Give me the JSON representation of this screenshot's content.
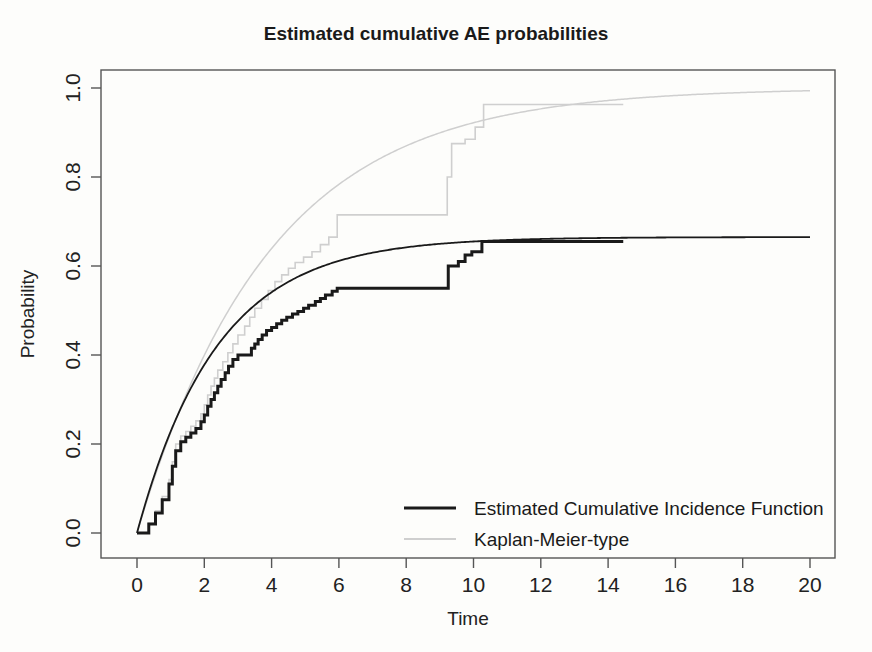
{
  "chart_data": {
    "type": "line",
    "title": "Estimated cumulative AE probabilities",
    "xlabel": "Time",
    "ylabel": "Probability",
    "xlim": [
      0,
      20
    ],
    "ylim": [
      0,
      1.0
    ],
    "xticks": [
      0,
      2,
      4,
      6,
      8,
      10,
      12,
      14,
      16,
      18,
      20
    ],
    "xtick_labels": [
      "0",
      "2",
      "4",
      "6",
      "8",
      "10",
      "12",
      "14",
      "16",
      "18",
      "20"
    ],
    "yticks": [
      0.0,
      0.2,
      0.4,
      0.6,
      0.8,
      1.0
    ],
    "ytick_labels": [
      "0.0",
      "0.2",
      "0.4",
      "0.6",
      "0.8",
      "1.0"
    ],
    "grid": false,
    "legend_position": "bottom-right",
    "series": [
      {
        "name": "Estimated Cumulative Incidence Function",
        "style": "step",
        "color": "#1a1a1a",
        "width": 3.0,
        "points": [
          [
            0.0,
            0.0
          ],
          [
            0.35,
            0.02
          ],
          [
            0.55,
            0.045
          ],
          [
            0.75,
            0.075
          ],
          [
            0.95,
            0.11
          ],
          [
            1.05,
            0.15
          ],
          [
            1.15,
            0.185
          ],
          [
            1.3,
            0.205
          ],
          [
            1.45,
            0.215
          ],
          [
            1.6,
            0.225
          ],
          [
            1.75,
            0.235
          ],
          [
            1.9,
            0.25
          ],
          [
            2.0,
            0.265
          ],
          [
            2.1,
            0.285
          ],
          [
            2.2,
            0.3
          ],
          [
            2.3,
            0.315
          ],
          [
            2.4,
            0.33
          ],
          [
            2.5,
            0.345
          ],
          [
            2.62,
            0.36
          ],
          [
            2.72,
            0.375
          ],
          [
            2.85,
            0.39
          ],
          [
            3.0,
            0.4
          ],
          [
            3.35,
            0.4
          ],
          [
            3.4,
            0.415
          ],
          [
            3.5,
            0.425
          ],
          [
            3.6,
            0.435
          ],
          [
            3.72,
            0.445
          ],
          [
            3.85,
            0.455
          ],
          [
            4.0,
            0.462
          ],
          [
            4.15,
            0.47
          ],
          [
            4.3,
            0.478
          ],
          [
            4.45,
            0.485
          ],
          [
            4.62,
            0.492
          ],
          [
            4.78,
            0.498
          ],
          [
            4.95,
            0.505
          ],
          [
            5.1,
            0.512
          ],
          [
            5.3,
            0.52
          ],
          [
            5.45,
            0.527
          ],
          [
            5.6,
            0.535
          ],
          [
            5.8,
            0.543
          ],
          [
            5.95,
            0.55
          ],
          [
            9.15,
            0.55
          ],
          [
            9.25,
            0.6
          ],
          [
            9.55,
            0.61
          ],
          [
            9.75,
            0.625
          ],
          [
            9.95,
            0.632
          ],
          [
            10.25,
            0.655
          ],
          [
            14.45,
            0.655
          ]
        ]
      },
      {
        "name": "Estimated Cumulative Incidence Function (model)",
        "style": "smooth",
        "color": "#1a1a1a",
        "width": 1.8,
        "asymptote": 0.665,
        "rate": 0.42,
        "points": [
          [
            0.0,
            0.0
          ],
          [
            0.5,
            0.127
          ],
          [
            1.0,
            0.227
          ],
          [
            1.5,
            0.311
          ],
          [
            2.0,
            0.378
          ],
          [
            2.5,
            0.432
          ],
          [
            3.0,
            0.476
          ],
          [
            3.5,
            0.512
          ],
          [
            4.0,
            0.541
          ],
          [
            4.5,
            0.564
          ],
          [
            5.0,
            0.583
          ],
          [
            5.5,
            0.598
          ],
          [
            6.0,
            0.611
          ],
          [
            7.0,
            0.629
          ],
          [
            8.0,
            0.641
          ],
          [
            9.0,
            0.649
          ],
          [
            10.0,
            0.655
          ],
          [
            12.0,
            0.66
          ],
          [
            14.0,
            0.663
          ],
          [
            16.0,
            0.664
          ],
          [
            18.0,
            0.665
          ],
          [
            20.0,
            0.665
          ]
        ]
      },
      {
        "name": "Kaplan-Meier-type",
        "style": "step",
        "color": "#cfcfcf",
        "width": 1.6,
        "points": [
          [
            0.0,
            0.0
          ],
          [
            0.35,
            0.022
          ],
          [
            0.55,
            0.05
          ],
          [
            0.75,
            0.082
          ],
          [
            0.95,
            0.12
          ],
          [
            1.05,
            0.16
          ],
          [
            1.15,
            0.2
          ],
          [
            1.3,
            0.218
          ],
          [
            1.45,
            0.228
          ],
          [
            1.6,
            0.24
          ],
          [
            1.75,
            0.252
          ],
          [
            1.9,
            0.268
          ],
          [
            2.0,
            0.288
          ],
          [
            2.1,
            0.31
          ],
          [
            2.2,
            0.33
          ],
          [
            2.3,
            0.348
          ],
          [
            2.4,
            0.366
          ],
          [
            2.55,
            0.385
          ],
          [
            2.7,
            0.405
          ],
          [
            2.85,
            0.425
          ],
          [
            3.0,
            0.445
          ],
          [
            3.2,
            0.465
          ],
          [
            3.35,
            0.485
          ],
          [
            3.5,
            0.505
          ],
          [
            3.7,
            0.525
          ],
          [
            3.9,
            0.545
          ],
          [
            4.1,
            0.565
          ],
          [
            4.3,
            0.58
          ],
          [
            4.5,
            0.595
          ],
          [
            4.7,
            0.608
          ],
          [
            4.95,
            0.62
          ],
          [
            5.2,
            0.632
          ],
          [
            5.45,
            0.648
          ],
          [
            5.7,
            0.665
          ],
          [
            5.95,
            0.715
          ],
          [
            9.15,
            0.715
          ],
          [
            9.22,
            0.8
          ],
          [
            9.35,
            0.875
          ],
          [
            9.75,
            0.885
          ],
          [
            10.05,
            0.912
          ],
          [
            10.3,
            0.963
          ],
          [
            14.45,
            0.963
          ]
        ]
      },
      {
        "name": "Kaplan-Meier-type (model)",
        "style": "smooth",
        "color": "#cfcfcf",
        "width": 1.5,
        "asymptote": 1.0,
        "rate": 0.255,
        "points": [
          [
            0.0,
            0.0
          ],
          [
            0.5,
            0.12
          ],
          [
            1.0,
            0.225
          ],
          [
            1.5,
            0.318
          ],
          [
            2.0,
            0.4
          ],
          [
            2.5,
            0.471
          ],
          [
            3.0,
            0.535
          ],
          [
            3.5,
            0.591
          ],
          [
            4.0,
            0.64
          ],
          [
            4.5,
            0.683
          ],
          [
            5.0,
            0.721
          ],
          [
            5.5,
            0.754
          ],
          [
            6.0,
            0.783
          ],
          [
            7.0,
            0.831
          ],
          [
            8.0,
            0.869
          ],
          [
            9.0,
            0.898
          ],
          [
            10.0,
            0.921
          ],
          [
            11.0,
            0.939
          ],
          [
            12.0,
            0.953
          ],
          [
            13.0,
            0.963
          ],
          [
            14.0,
            0.971
          ],
          [
            15.0,
            0.978
          ],
          [
            16.0,
            0.983
          ],
          [
            17.0,
            0.987
          ],
          [
            18.0,
            0.99
          ],
          [
            19.0,
            0.993
          ],
          [
            20.0,
            0.996
          ]
        ]
      }
    ],
    "legend_entries": [
      {
        "label": "Estimated Cumulative Incidence Function",
        "color": "#1a1a1a",
        "width": 3.0
      },
      {
        "label": "Kaplan-Meier-type",
        "color": "#cfcfcf",
        "width": 2.0
      }
    ]
  }
}
